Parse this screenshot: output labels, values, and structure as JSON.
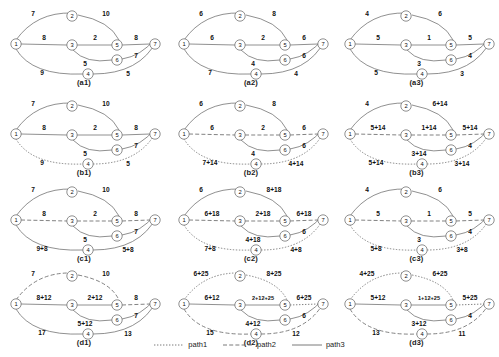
{
  "figure": {
    "rows": 4,
    "cols": 3,
    "node_ids": [
      "1",
      "2",
      "3",
      "4",
      "5",
      "6",
      "7"
    ]
  },
  "legend": {
    "items": [
      {
        "label": "path1",
        "style": "dotted"
      },
      {
        "label": "path2",
        "style": "dashed"
      },
      {
        "label": "path3",
        "style": "solid"
      }
    ]
  },
  "panels": [
    {
      "caption": "(a1)",
      "edges": [
        {
          "id": "1-2",
          "label": "7",
          "style": "solid"
        },
        {
          "id": "2-5",
          "label": "10",
          "style": "solid"
        },
        {
          "id": "1-3",
          "label": "8",
          "style": "solid"
        },
        {
          "id": "3-5",
          "label": "2",
          "style": "solid"
        },
        {
          "id": "5-7",
          "label": "8",
          "style": "solid"
        },
        {
          "id": "3-6",
          "label": "5",
          "style": "solid"
        },
        {
          "id": "6-7",
          "label": "7",
          "style": "solid"
        },
        {
          "id": "1-4",
          "label": "9",
          "style": "solid"
        },
        {
          "id": "4-7",
          "label": "5",
          "style": "solid"
        }
      ]
    },
    {
      "caption": "(a2)",
      "edges": [
        {
          "id": "1-2",
          "label": "6",
          "style": "solid"
        },
        {
          "id": "2-5",
          "label": "8",
          "style": "solid"
        },
        {
          "id": "1-3",
          "label": "6",
          "style": "solid"
        },
        {
          "id": "3-5",
          "label": "2",
          "style": "solid"
        },
        {
          "id": "5-7",
          "label": "6",
          "style": "solid"
        },
        {
          "id": "3-6",
          "label": "4",
          "style": "solid"
        },
        {
          "id": "6-7",
          "label": "6",
          "style": "solid"
        },
        {
          "id": "1-4",
          "label": "7",
          "style": "solid"
        },
        {
          "id": "4-7",
          "label": "4",
          "style": "solid"
        }
      ]
    },
    {
      "caption": "(a3)",
      "edges": [
        {
          "id": "1-2",
          "label": "4",
          "style": "solid"
        },
        {
          "id": "2-5",
          "label": "6",
          "style": "solid"
        },
        {
          "id": "1-3",
          "label": "5",
          "style": "solid"
        },
        {
          "id": "3-5",
          "label": "1",
          "style": "solid"
        },
        {
          "id": "5-7",
          "label": "5",
          "style": "solid"
        },
        {
          "id": "3-6",
          "label": "3",
          "style": "solid"
        },
        {
          "id": "6-7",
          "label": "4",
          "style": "solid"
        },
        {
          "id": "1-4",
          "label": "5",
          "style": "solid"
        },
        {
          "id": "4-7",
          "label": "3",
          "style": "solid"
        }
      ]
    },
    {
      "caption": "(b1)",
      "edges": [
        {
          "id": "1-2",
          "label": "7",
          "style": "solid"
        },
        {
          "id": "2-5",
          "label": "10",
          "style": "solid"
        },
        {
          "id": "1-3",
          "label": "8",
          "style": "solid"
        },
        {
          "id": "3-5",
          "label": "2",
          "style": "solid"
        },
        {
          "id": "5-7",
          "label": "8",
          "style": "solid"
        },
        {
          "id": "3-6",
          "label": "5",
          "style": "solid"
        },
        {
          "id": "6-7",
          "label": "7",
          "style": "solid"
        },
        {
          "id": "1-4",
          "label": "9",
          "style": "dotted"
        },
        {
          "id": "4-7",
          "label": "5",
          "style": "dotted"
        }
      ]
    },
    {
      "caption": "(b2)",
      "edges": [
        {
          "id": "1-2",
          "label": "6",
          "style": "solid"
        },
        {
          "id": "2-5",
          "label": "8",
          "style": "solid"
        },
        {
          "id": "1-3",
          "label": "6",
          "style": "dashed"
        },
        {
          "id": "3-5",
          "label": "2",
          "style": "dashed"
        },
        {
          "id": "5-7",
          "label": "6",
          "style": "dashed"
        },
        {
          "id": "3-6",
          "label": "4",
          "style": "solid"
        },
        {
          "id": "6-7",
          "label": "6",
          "style": "solid"
        },
        {
          "id": "1-4",
          "label": "7+14",
          "style": "dotted"
        },
        {
          "id": "4-7",
          "label": "4+14",
          "style": "dotted"
        }
      ]
    },
    {
      "caption": "(b3)",
      "edges": [
        {
          "id": "1-2",
          "label": "4",
          "style": "solid"
        },
        {
          "id": "2-5",
          "label": "6+14",
          "style": "solid"
        },
        {
          "id": "1-3",
          "label": "5+14",
          "style": "dashed"
        },
        {
          "id": "3-5",
          "label": "1+14",
          "style": "dashed"
        },
        {
          "id": "5-7",
          "label": "5+14",
          "style": "dashed"
        },
        {
          "id": "3-6",
          "label": "3+14",
          "style": "solid"
        },
        {
          "id": "6-7",
          "label": "4",
          "style": "solid"
        },
        {
          "id": "1-4",
          "label": "5+14",
          "style": "dotted"
        },
        {
          "id": "4-7",
          "label": "3+14",
          "style": "dotted"
        }
      ]
    },
    {
      "caption": "(c1)",
      "edges": [
        {
          "id": "1-2",
          "label": "7",
          "style": "solid"
        },
        {
          "id": "2-5",
          "label": "10",
          "style": "solid"
        },
        {
          "id": "1-3",
          "label": "8",
          "style": "dashed"
        },
        {
          "id": "3-5",
          "label": "2",
          "style": "dashed"
        },
        {
          "id": "5-7",
          "label": "8",
          "style": "dashed"
        },
        {
          "id": "3-6",
          "label": "5",
          "style": "solid"
        },
        {
          "id": "6-7",
          "label": "7",
          "style": "solid"
        },
        {
          "id": "1-4",
          "label": "9+8",
          "style": "solid"
        },
        {
          "id": "4-7",
          "label": "5+8",
          "style": "solid"
        }
      ]
    },
    {
      "caption": "(c2)",
      "edges": [
        {
          "id": "1-2",
          "label": "6",
          "style": "solid"
        },
        {
          "id": "2-5",
          "label": "8+18",
          "style": "solid"
        },
        {
          "id": "1-3",
          "label": "6+18",
          "style": "dashed"
        },
        {
          "id": "3-5",
          "label": "2+18",
          "style": "dashed"
        },
        {
          "id": "5-7",
          "label": "6+18",
          "style": "dashed"
        },
        {
          "id": "3-6",
          "label": "4+18",
          "style": "solid"
        },
        {
          "id": "6-7",
          "label": "6",
          "style": "solid"
        },
        {
          "id": "1-4",
          "label": "7+8",
          "style": "dotted"
        },
        {
          "id": "4-7",
          "label": "4+8",
          "style": "dotted"
        }
      ]
    },
    {
      "caption": "(c3)",
      "edges": [
        {
          "id": "1-2",
          "label": "4",
          "style": "solid"
        },
        {
          "id": "2-5",
          "label": "6",
          "style": "solid"
        },
        {
          "id": "1-3",
          "label": "5",
          "style": "dashed"
        },
        {
          "id": "3-5",
          "label": "1",
          "style": "dashed"
        },
        {
          "id": "5-7",
          "label": "5",
          "style": "dashed"
        },
        {
          "id": "3-6",
          "label": "3",
          "style": "solid"
        },
        {
          "id": "6-7",
          "label": "4",
          "style": "solid"
        },
        {
          "id": "1-4",
          "label": "5+8",
          "style": "dotted"
        },
        {
          "id": "4-7",
          "label": "3+8",
          "style": "dotted"
        }
      ]
    },
    {
      "caption": "(d1)",
      "edges": [
        {
          "id": "1-2",
          "label": "7",
          "style": "dashed"
        },
        {
          "id": "2-5",
          "label": "10",
          "style": "dashed"
        },
        {
          "id": "1-3",
          "label": "8+12",
          "style": "solid"
        },
        {
          "id": "3-5",
          "label": "2+12",
          "style": "solid"
        },
        {
          "id": "5-7",
          "label": "8",
          "style": "dashed"
        },
        {
          "id": "3-6",
          "label": "5+12",
          "style": "solid"
        },
        {
          "id": "6-7",
          "label": "7",
          "style": "solid"
        },
        {
          "id": "1-4",
          "label": "17",
          "style": "solid"
        },
        {
          "id": "4-7",
          "label": "13",
          "style": "solid"
        }
      ]
    },
    {
      "caption": "(d2)",
      "edges": [
        {
          "id": "1-2",
          "label": "6+25",
          "style": "dotted"
        },
        {
          "id": "2-5",
          "label": "8+25",
          "style": "dotted"
        },
        {
          "id": "1-3",
          "label": "6+12",
          "style": "solid"
        },
        {
          "id": "3-5",
          "label": "2+12+25",
          "style": "solid"
        },
        {
          "id": "5-7",
          "label": "6+25",
          "style": "dotted"
        },
        {
          "id": "3-6",
          "label": "4+12",
          "style": "solid"
        },
        {
          "id": "6-7",
          "label": "6",
          "style": "solid"
        },
        {
          "id": "1-4",
          "label": "15",
          "style": "dashed"
        },
        {
          "id": "4-7",
          "label": "12",
          "style": "dashed"
        }
      ]
    },
    {
      "caption": "(d3)",
      "edges": [
        {
          "id": "1-2",
          "label": "4+25",
          "style": "dotted"
        },
        {
          "id": "2-5",
          "label": "6+25",
          "style": "dotted"
        },
        {
          "id": "1-3",
          "label": "5+12",
          "style": "solid"
        },
        {
          "id": "3-5",
          "label": "1+12+25",
          "style": "solid"
        },
        {
          "id": "5-7",
          "label": "5+25",
          "style": "dotted"
        },
        {
          "id": "3-6",
          "label": "3+12",
          "style": "solid"
        },
        {
          "id": "6-7",
          "label": "4",
          "style": "solid"
        },
        {
          "id": "1-4",
          "label": "13",
          "style": "dashed"
        },
        {
          "id": "4-7",
          "label": "11",
          "style": "dashed"
        }
      ]
    }
  ]
}
